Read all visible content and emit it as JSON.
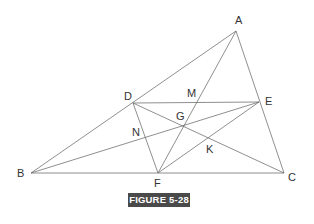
{
  "figure": {
    "caption": "FIGURE 5-28",
    "caption_bg": "#4a4a4a",
    "line_color": "#6a6a6a",
    "points": {
      "A": {
        "x": 236,
        "y": 31,
        "lx": 235,
        "ly": 24,
        "label": "A"
      },
      "B": {
        "x": 31,
        "y": 173,
        "lx": 17,
        "ly": 177,
        "label": "B"
      },
      "C": {
        "x": 284,
        "y": 173,
        "lx": 288,
        "ly": 181,
        "label": "C"
      },
      "D": {
        "x": 133,
        "y": 103,
        "lx": 124,
        "ly": 100,
        "label": "D"
      },
      "E": {
        "x": 259,
        "y": 102,
        "lx": 265,
        "ly": 105,
        "label": "E"
      },
      "F": {
        "x": 158,
        "y": 173,
        "lx": 154,
        "ly": 187,
        "label": "F"
      },
      "G": {
        "x": 184,
        "y": 126,
        "lx": 176,
        "ly": 120,
        "label": "G"
      },
      "K": {
        "x": 209,
        "y": 138,
        "lx": 206,
        "ly": 153,
        "label": "K"
      },
      "N": {
        "x": 145,
        "y": 138,
        "lx": 132,
        "ly": 136,
        "label": "N"
      },
      "M": {
        "x": 193,
        "y": 102,
        "lx": 187,
        "ly": 97,
        "label": "M"
      }
    },
    "segments": [
      [
        "A",
        "B"
      ],
      [
        "A",
        "C"
      ],
      [
        "B",
        "C"
      ],
      [
        "D",
        "E"
      ],
      [
        "D",
        "F"
      ],
      [
        "E",
        "F"
      ],
      [
        "A",
        "F"
      ],
      [
        "B",
        "E"
      ],
      [
        "D",
        "C"
      ]
    ]
  }
}
